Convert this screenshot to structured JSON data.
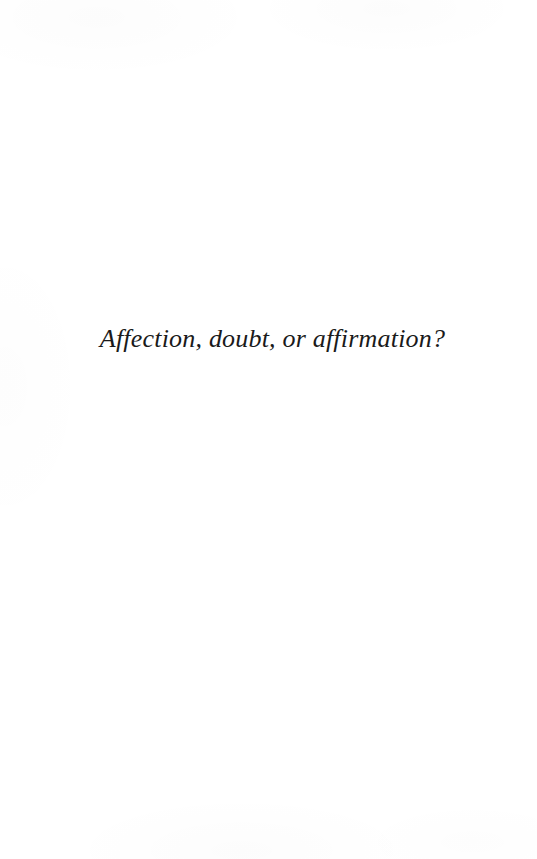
{
  "page": {
    "type": "scanned-book-page",
    "width": 537,
    "height": 859,
    "background_color": "#ffffff",
    "ink_color": "#1a1a1a"
  },
  "content": {
    "epigraph": {
      "text": "Affection, doubt, or affirmation?",
      "style": "italic-serif",
      "alignment": "center"
    }
  }
}
